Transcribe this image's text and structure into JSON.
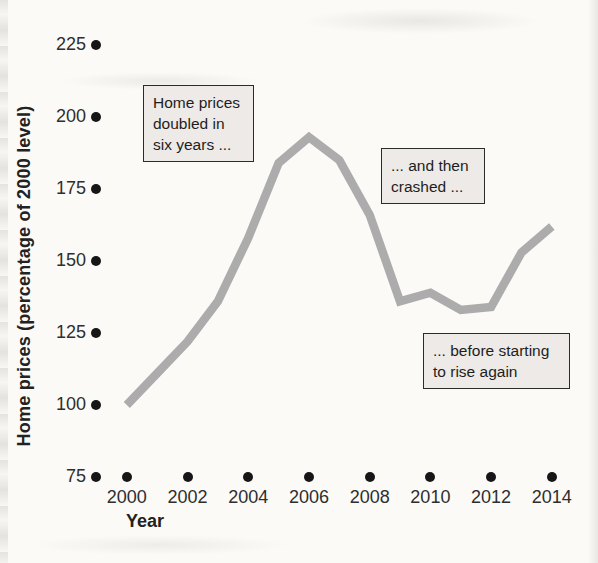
{
  "figure": {
    "x_axis_title": "Year",
    "y_axis_title": "Home prices (percentage of 2000 level)"
  },
  "chart_data": {
    "type": "line",
    "title": "",
    "xlabel": "Year",
    "ylabel": "Home prices (percentage of 2000 level)",
    "x": [
      2000,
      2001,
      2002,
      2003,
      2004,
      2005,
      2006,
      2007,
      2008,
      2009,
      2010,
      2011,
      2012,
      2013,
      2014
    ],
    "values": [
      100,
      111,
      122,
      136,
      158,
      184,
      193,
      185,
      166,
      136,
      139,
      133,
      134,
      153,
      162
    ],
    "xticks": [
      2000,
      2002,
      2004,
      2006,
      2008,
      2010,
      2012,
      2014
    ],
    "yticks": [
      225,
      200,
      175,
      150,
      125,
      100,
      75
    ],
    "ylim": [
      75,
      235
    ],
    "xlim": [
      2000,
      2014
    ],
    "grid": false,
    "legend": "none",
    "tick_marker": "filled-dot",
    "line_color": "#acacac",
    "tick_dot_color": "#161616",
    "annotation_bg": "#edeae7",
    "annotations": [
      {
        "text": "Home prices\ndoubled in\nsix years ..."
      },
      {
        "text": "... and then\ncrashed ..."
      },
      {
        "text": "... before starting\nto rise again"
      }
    ]
  }
}
